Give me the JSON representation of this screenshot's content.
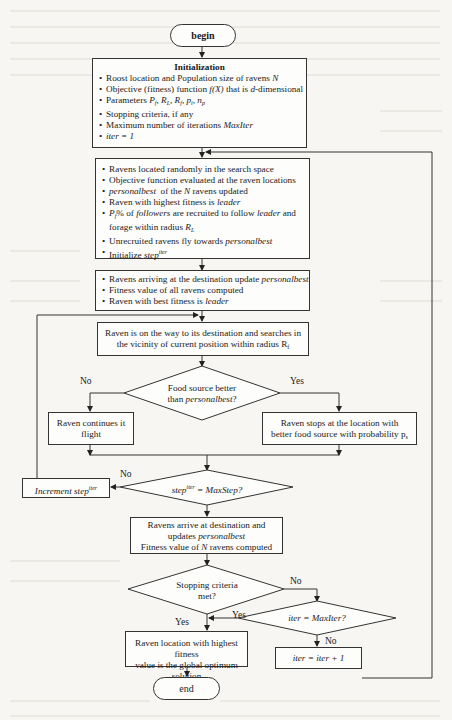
{
  "diagram": {
    "type": "flowchart",
    "start": "begin",
    "end": "end",
    "initialization": {
      "title": "Initialization",
      "items": [
        "Roost location and Population size of ravens N",
        "Objective (fitness) function f(X) that is d-dimensional",
        "Parameters Pf, RL, Rf, pi, np",
        "Stopping criteria, if any",
        "Maximum number of iterations MaxIter",
        "iter = 1"
      ]
    },
    "setup": {
      "items": [
        "Ravens located randomly in the search space",
        "Objective function evaluated at the raven locations",
        "personalbest of the N ravens updated",
        "Raven with highest fitness is leader",
        "Pf% of followers are recruited to follow leader and forage within radius RL",
        "Unrecruited ravens fly towards personalbest",
        "Initialize step^iter"
      ]
    },
    "arrival": {
      "items": [
        "Ravens arriving at the destination update personalbest",
        "Fitness value of all ravens computed",
        "Raven with best fitness is leader"
      ]
    },
    "search": "Raven is on the way to its destination and searches in the vicinity of current position within radius Rf",
    "food_decision": "Food source better than personalbest?",
    "food_no": "Raven continues it flight",
    "food_yes": "Raven stops at the location with better food source with probability ps",
    "step_decision": "step^iter = MaxStep?",
    "increment_step": "Increment step^iter",
    "arrive_update": "Ravens arrive at destination and updates personalbest Fitness value of N ravens computed",
    "stop_decision": "Stopping criteria met?",
    "iter_decision": "iter = MaxIter?",
    "iter_increment": "iter = iter + 1",
    "result": "Raven location with highest fitness value is the global optimum solution",
    "labels": {
      "yes": "Yes",
      "no": "No"
    }
  }
}
